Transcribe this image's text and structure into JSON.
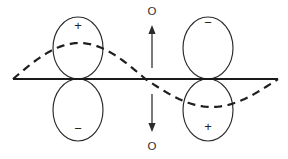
{
  "figure": {
    "background_color": "#ffffff",
    "width": 288,
    "height": 159
  },
  "colors": {
    "lobe_stroke": "#2a2a2a",
    "axis_stroke": "#1a1a1a",
    "wave_stroke": "#1f1f1f",
    "arrow_stroke": "#333333",
    "text": "#242424"
  },
  "axis": {
    "name": "horizontal-node-axis",
    "x_start": 13,
    "x_end": 278,
    "y": 79
  },
  "orbitals": [
    {
      "id": "left-upper-lobe",
      "sign": "+",
      "center_x": 78,
      "center_y": 48,
      "rx": 25,
      "ry": 31,
      "sign_x": 78,
      "sign_y": 25
    },
    {
      "id": "left-lower-lobe",
      "sign": "−",
      "center_x": 78,
      "center_y": 110,
      "rx": 25,
      "ry": 31,
      "sign_x": 78,
      "sign_y": 128
    },
    {
      "id": "right-upper-lobe",
      "sign": "−",
      "center_x": 208,
      "center_y": 48,
      "rx": 25,
      "ry": 31,
      "sign_x": 208,
      "sign_y": 22
    },
    {
      "id": "right-lower-lobe",
      "sign": "+",
      "center_x": 208,
      "center_y": 110,
      "rx": 25,
      "ry": 31,
      "sign_x": 208,
      "sign_y": 126
    }
  ],
  "wave": {
    "name": "dashed-sine-wave",
    "style": "dashed",
    "x_start": 13,
    "x_end": 278,
    "baseline_y": 79,
    "crest_y": 43,
    "trough_y": 107,
    "node_x": 152,
    "description": "single sine period crossing axis at node"
  },
  "arrows": {
    "up": {
      "name": "displacement-arrow-up",
      "x": 152,
      "y_tail": 68,
      "y_head": 25,
      "direction": "up"
    },
    "down": {
      "name": "displacement-arrow-down",
      "x": 152,
      "y_tail": 94,
      "y_head": 132,
      "direction": "down"
    }
  },
  "labels": {
    "top": "O",
    "bottom": "O"
  },
  "signs": {
    "left_upper": "+",
    "left_lower": "−",
    "right_upper": "−",
    "right_lower": "+"
  }
}
